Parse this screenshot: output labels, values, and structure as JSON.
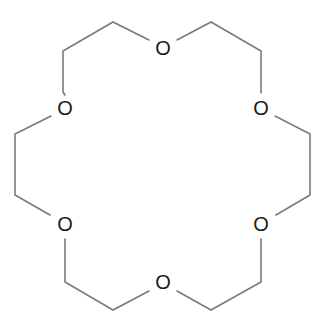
{
  "molecule": {
    "name": "",
    "atoms": [
      {
        "label": "O",
        "x": 163,
        "y": 48
      },
      {
        "label": "O",
        "x": 261,
        "y": 108
      },
      {
        "label": "O",
        "x": 261,
        "y": 224
      },
      {
        "label": "O",
        "x": 163,
        "y": 282
      },
      {
        "label": "O",
        "x": 65,
        "y": 224
      },
      {
        "label": "O",
        "x": 65,
        "y": 108
      }
    ],
    "colors": {
      "bond": "#7a7a7a",
      "atom_text": "#1a1a1a",
      "background": "#ffffff"
    }
  }
}
